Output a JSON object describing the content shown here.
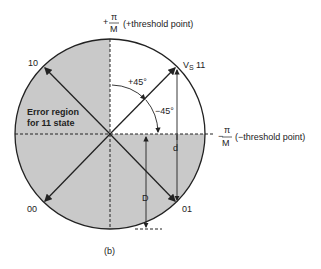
{
  "diagram": {
    "caption": "(b)",
    "top_threshold": {
      "sign": "+",
      "frac_num": "π",
      "frac_den": "M",
      "label": "(+threshold point)"
    },
    "right_threshold": {
      "sign": "−",
      "frac_num": "π",
      "frac_den": "M",
      "label": "(−threshold point)"
    },
    "points": {
      "p10": "10",
      "p11_vs": "V",
      "p11_sub": "S",
      "p11": "11",
      "p00": "00",
      "p01": "01"
    },
    "angles": {
      "plus": "+45°",
      "minus": "−45°"
    },
    "error_region": {
      "line1": "Error region",
      "line2": "for 11 state"
    },
    "dims": {
      "d": "d",
      "D": "D"
    },
    "colors": {
      "shade": "#c9c9c9",
      "line": "#222222"
    }
  }
}
